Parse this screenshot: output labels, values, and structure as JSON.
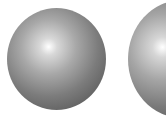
{
  "scene": {
    "background": "#ffffff",
    "objects": [
      {
        "name": "left-sphere",
        "shading": "grayscale radial",
        "highlight": "upper-left"
      },
      {
        "name": "right-sphere",
        "shading": "grayscale radial",
        "highlight": "upper-left",
        "cropped": "right edge"
      }
    ]
  }
}
